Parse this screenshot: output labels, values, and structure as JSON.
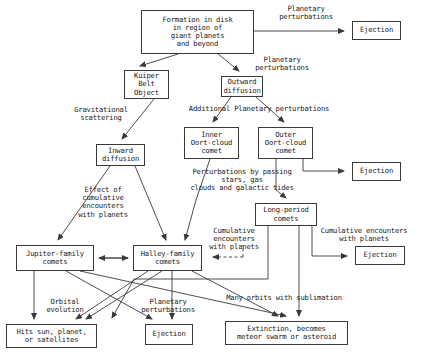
{
  "diagram": {
    "line_color": "#3a3a3a",
    "text_color": "#1a1a1a",
    "background": "#ffffff",
    "nodes": [
      {
        "id": "formation",
        "text": "Formation in disk\nin region of\ngiant planets\nand beyond",
        "x": 141,
        "y": 10,
        "w": 113,
        "h": 44,
        "fontsize": 7.2,
        "border": "solid"
      },
      {
        "id": "ejection1",
        "text": "Ejection",
        "x": 352,
        "y": 21,
        "w": 49,
        "h": 19,
        "fontsize": 7.2,
        "border": "solid"
      },
      {
        "id": "kuiper",
        "text": "Kuiper\nBelt\nObject",
        "x": 124,
        "y": 70,
        "w": 45,
        "h": 29,
        "fontsize": 7.2,
        "border": "solid"
      },
      {
        "id": "outward",
        "text": "Outward\ndiffusion",
        "x": 221,
        "y": 76,
        "w": 42,
        "h": 21,
        "fontsize": 7.2,
        "border": "solid"
      },
      {
        "id": "inner_oort",
        "text": "Inner\nOort-cloud\ncomet",
        "x": 184,
        "y": 127,
        "w": 55,
        "h": 32,
        "fontsize": 7.2,
        "border": "solid"
      },
      {
        "id": "outer_oort",
        "text": "Outer\nOort-cloud\ncomet",
        "x": 258,
        "y": 127,
        "w": 55,
        "h": 32,
        "fontsize": 7.2,
        "border": "solid"
      },
      {
        "id": "inward",
        "text": "Inward\ndiffusion",
        "x": 96,
        "y": 144,
        "w": 49,
        "h": 22,
        "fontsize": 7.2,
        "border": "solid"
      },
      {
        "id": "ejection2",
        "text": "Ejection",
        "x": 352,
        "y": 162,
        "w": 49,
        "h": 19,
        "fontsize": 7.2,
        "border": "solid"
      },
      {
        "id": "longperiod",
        "text": "Long-period\ncomets",
        "x": 255,
        "y": 203,
        "w": 62,
        "h": 23,
        "fontsize": 7.2,
        "border": "solid"
      },
      {
        "id": "jupiter",
        "text": "Jupiter-family\ncomets",
        "x": 16,
        "y": 245,
        "w": 78,
        "h": 26,
        "fontsize": 7.2,
        "border": "solid"
      },
      {
        "id": "halley",
        "text": "Halley-family\ncomets",
        "x": 133,
        "y": 245,
        "w": 69,
        "h": 26,
        "fontsize": 7.2,
        "border": "solid"
      },
      {
        "id": "ejection3",
        "text": "Ejection",
        "x": 355,
        "y": 246,
        "w": 50,
        "h": 19,
        "fontsize": 7.2,
        "border": "solid"
      },
      {
        "id": "hits_sun",
        "text": "Hits sun, planet,\nor satellites",
        "x": 6,
        "y": 324,
        "w": 91,
        "h": 24,
        "fontsize": 7.2,
        "border": "solid"
      },
      {
        "id": "ejection4",
        "text": "Ejection",
        "x": 145,
        "y": 324,
        "w": 48,
        "h": 21,
        "fontsize": 7.2,
        "border": "solid"
      },
      {
        "id": "extinction",
        "text": "Extinction, becomes\nmeteor swarm or asteroid",
        "x": 225,
        "y": 321,
        "w": 123,
        "h": 24,
        "fontsize": 7.2,
        "border": "solid"
      }
    ],
    "labels": [
      {
        "id": "planetary_perturbations_top",
        "text": "Planetary\nperturbations",
        "x": 262,
        "y": 5,
        "w": 88,
        "fontsize": 7.2
      },
      {
        "id": "planetary_perturbations_mid",
        "text": "Planetary\nperturbations",
        "x": 238,
        "y": 56,
        "w": 88,
        "fontsize": 7.2
      },
      {
        "id": "gravitational_scattering",
        "text": "Gravitational\nscattering",
        "x": 58,
        "y": 106,
        "w": 86,
        "fontsize": 7.2
      },
      {
        "id": "additional_perturbations",
        "text": "Additional Planetary perturbations",
        "x": 156,
        "y": 105,
        "w": 206,
        "fontsize": 7.2
      },
      {
        "id": "perturbations_passing_stars",
        "text": "Perturbations by passing\nstars, gas\nclouds and galactic tides",
        "x": 158,
        "y": 168,
        "w": 168,
        "fontsize": 7.2
      },
      {
        "id": "effect_cumulative_encounters",
        "text": "Effect of\ncumulative\nencounters\nwith planets",
        "x": 62,
        "y": 186,
        "w": 82,
        "fontsize": 7.2
      },
      {
        "id": "cumulative_encounters_halley",
        "text": "Cumulative\nencounters\nwith planets",
        "x": 196,
        "y": 227,
        "w": 76,
        "fontsize": 7.2
      },
      {
        "id": "cumulative_encounters_right",
        "text": "Cumulative encounters\nwith planets",
        "x": 306,
        "y": 227,
        "w": 116,
        "fontsize": 7.2
      },
      {
        "id": "orbital_evolution",
        "text": "Orbital\nevolution",
        "x": 32,
        "y": 298,
        "w": 66,
        "fontsize": 7.2
      },
      {
        "id": "planetary_perturbations_bot",
        "text": "Planetary\nperturbations",
        "x": 124,
        "y": 298,
        "w": 88,
        "fontsize": 7.2
      },
      {
        "id": "many_orbits_sublimation",
        "text": "Many orbits with sublimation",
        "x": 198,
        "y": 294,
        "w": 172,
        "fontsize": 7.2
      }
    ],
    "edges": [
      {
        "id": "formation-to-ejection1",
        "from": "formation",
        "to": "ejection1",
        "kind": "orthogonal-arrow"
      },
      {
        "id": "formation-to-kuiper",
        "from": "formation",
        "to": "kuiper",
        "kind": "diagonal-arrow"
      },
      {
        "id": "formation-to-outward",
        "from": "formation",
        "to": "outward",
        "kind": "diagonal-arrow"
      },
      {
        "id": "kuiper-to-inward",
        "from": "kuiper",
        "to": "inward",
        "kind": "diagonal-arrow"
      },
      {
        "id": "outward-to-inner-oort",
        "from": "outward",
        "to": "inner_oort",
        "kind": "diagonal-arrow"
      },
      {
        "id": "outward-to-outer-oort",
        "from": "outward",
        "to": "outer_oort",
        "kind": "diagonal-arrow"
      },
      {
        "id": "outer-oort-to-ejection2",
        "from": "outer_oort",
        "to": "ejection2",
        "kind": "orthogonal-arrow"
      },
      {
        "id": "inner-oort-to-longperiod",
        "from": "inner_oort",
        "to": "longperiod",
        "kind": "diagonal-line"
      },
      {
        "id": "outer-oort-to-longperiod",
        "from": "outer_oort",
        "to": "longperiod",
        "kind": "straight-arrow"
      },
      {
        "id": "inward-to-jupiter",
        "from": "inward",
        "to": "jupiter",
        "kind": "diagonal-arrow"
      },
      {
        "id": "inward-to-halley",
        "from": "inward",
        "to": "halley",
        "kind": "diagonal-arrow"
      },
      {
        "id": "longperiod-to-halley",
        "from": "longperiod",
        "to": "halley",
        "kind": "dashed-arrow"
      },
      {
        "id": "longperiod-to-ejection3",
        "from": "longperiod",
        "to": "ejection3",
        "kind": "orthogonal-arrow"
      },
      {
        "id": "jupiter-halley-exchange",
        "from": "jupiter",
        "to": "halley",
        "kind": "double-arrow"
      },
      {
        "id": "jupiter-to-hits-sun",
        "from": "jupiter",
        "to": "hits_sun",
        "kind": "vertical-arrow"
      },
      {
        "id": "jupiter-to-ejection4",
        "from": "jupiter",
        "to": "ejection4",
        "kind": "diagonal-arrow"
      },
      {
        "id": "jupiter-to-extinction",
        "from": "jupiter",
        "to": "extinction",
        "kind": "diagonal-arrow"
      },
      {
        "id": "halley-to-hits-sun",
        "from": "halley",
        "to": "hits_sun",
        "kind": "diagonal-arrow"
      },
      {
        "id": "halley-to-ejection4",
        "from": "halley",
        "to": "ejection4",
        "kind": "vertical-arrow"
      },
      {
        "id": "halley-to-extinction",
        "from": "halley",
        "to": "extinction",
        "kind": "diagonal-arrow"
      },
      {
        "id": "longperiod-to-extinction",
        "from": "longperiod",
        "to": "extinction",
        "kind": "vertical-arrow"
      },
      {
        "id": "longperiod-to-hits-sun",
        "from": "longperiod",
        "to": "hits_sun",
        "kind": "diagonal-arrow"
      }
    ]
  }
}
